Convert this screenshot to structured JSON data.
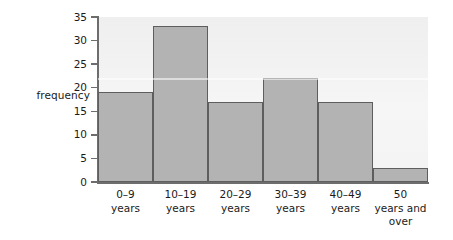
{
  "chart_data": {
    "type": "bar",
    "title": "",
    "subtitle": "",
    "xlabel": "",
    "ylabel": "frequency",
    "categories": [
      "0–9\nyears",
      "10–19\nyears",
      "20–29\nyears",
      "30–39\nyears",
      "40–49\nyears",
      "50\nyears and\nover"
    ],
    "values": [
      19,
      33,
      17,
      22,
      17,
      3
    ],
    "ylim": [
      0,
      35
    ],
    "ytick_labels": [
      "0",
      "5",
      "10",
      "15",
      "20",
      "25",
      "30",
      "35"
    ],
    "ytick_values": [
      0,
      5,
      10,
      15,
      20,
      25,
      30,
      35
    ],
    "grid": false,
    "legend": false,
    "legend_position": "none",
    "bar_fill_color": "#b3b3b3",
    "bar_edge_color": "#5e5e5e",
    "plot_background_color": "#f4f4f4",
    "axis_color": "#6d6d6d",
    "text_color": "#1a1a1a",
    "bars_contiguous": true
  }
}
